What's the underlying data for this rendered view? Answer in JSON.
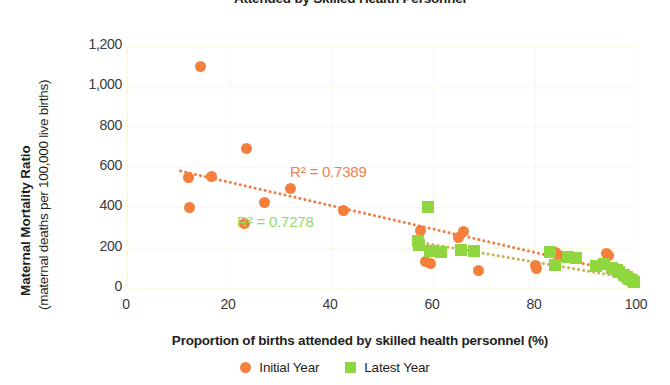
{
  "chart_data": {
    "type": "scatter",
    "title": "Attended by Skilled Health Personnel",
    "xlabel": "Proportion of births attended by skilled health personnel (%)",
    "ylabel_main": "Maternal Mortality Ratio",
    "ylabel_sub": "(maternal deaths per 100,000 live births)",
    "xlim": [
      0,
      100
    ],
    "ylim": [
      0,
      1200
    ],
    "xticks": [
      "0",
      "20",
      "40",
      "60",
      "80",
      "100"
    ],
    "xtick_values": [
      0,
      20,
      40,
      60,
      80,
      100
    ],
    "yticks": [
      "0",
      "200",
      "400",
      "600",
      "800",
      "1,000",
      "1,200"
    ],
    "ytick_values": [
      0,
      200,
      400,
      600,
      800,
      1000,
      1200
    ],
    "grid": true,
    "grid_color": "#fafae3",
    "legend_position": "bottom",
    "series": [
      {
        "name": "Initial Year",
        "marker": "circle",
        "color": "#f4803c",
        "points": [
          [
            12.0,
            550
          ],
          [
            12.2,
            400
          ],
          [
            14.5,
            1100
          ],
          [
            16.5,
            555
          ],
          [
            23.0,
            320
          ],
          [
            23.5,
            690
          ],
          [
            27.0,
            425
          ],
          [
            32.0,
            495
          ],
          [
            42.5,
            385
          ],
          [
            57.5,
            285
          ],
          [
            58.5,
            130
          ],
          [
            59.5,
            120
          ],
          [
            65.0,
            250
          ],
          [
            66.0,
            280
          ],
          [
            69.0,
            85
          ],
          [
            80.0,
            110
          ],
          [
            80.3,
            95
          ],
          [
            84.0,
            175
          ],
          [
            84.5,
            165
          ],
          [
            85.0,
            155
          ],
          [
            94.0,
            170
          ],
          [
            94.5,
            160
          ],
          [
            96.0,
            95
          ],
          [
            98.0,
            65
          ],
          [
            98.5,
            45
          ],
          [
            99.0,
            35
          ]
        ]
      },
      {
        "name": "Latest Year",
        "marker": "square",
        "color": "#8fd63f",
        "points": [
          [
            57.0,
            235
          ],
          [
            57.3,
            215
          ],
          [
            59.0,
            400
          ],
          [
            59.5,
            185
          ],
          [
            61.5,
            180
          ],
          [
            65.5,
            190
          ],
          [
            68.0,
            185
          ],
          [
            83.0,
            180
          ],
          [
            84.0,
            115
          ],
          [
            86.5,
            155
          ],
          [
            88.0,
            150
          ],
          [
            92.0,
            110
          ],
          [
            93.5,
            120
          ],
          [
            95.0,
            100
          ],
          [
            96.0,
            90
          ],
          [
            96.5,
            80
          ],
          [
            97.5,
            65
          ],
          [
            98.0,
            55
          ],
          [
            98.5,
            45
          ],
          [
            99.0,
            40
          ],
          [
            99.5,
            30
          ]
        ]
      }
    ],
    "trendlines": [
      {
        "name": "Initial Year trendline",
        "color": "#f0804a",
        "style": "dotted",
        "x_start": 10.5,
        "y_start": 580,
        "x_end": 100.0,
        "y_end": 60
      },
      {
        "name": "Latest Year trendline",
        "color": "#c8b45a",
        "style": "dotted",
        "x_start": 57.0,
        "y_start": 228,
        "x_end": 100.0,
        "y_end": 42
      }
    ],
    "annotations": [
      {
        "text": "R² = 0.7389",
        "color": "#f0804a",
        "series": "Initial Year"
      },
      {
        "text": "R² = 0.7278",
        "color": "#95d95b",
        "series": "Latest Year"
      }
    ]
  },
  "legend": {
    "items": [
      {
        "label": "Initial Year",
        "marker": "circle",
        "color": "#f4803c"
      },
      {
        "label": "Latest Year",
        "marker": "square",
        "color": "#8fd63f"
      }
    ]
  }
}
